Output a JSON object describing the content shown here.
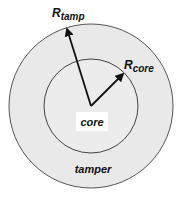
{
  "diagram": {
    "labels": {
      "r_tamp_main": "R",
      "r_tamp_sub": "tamp",
      "r_core_main": "R",
      "r_core_sub": "core",
      "core": "core",
      "tamper": "tamper"
    },
    "geometry": {
      "center": [
        91,
        106
      ],
      "outer_radius": 82,
      "inner_radius": 47
    },
    "colors": {
      "background": "#ffffff",
      "tamper_fill": "#e9e9e9",
      "core_fill": "#ececec",
      "stroke": "#555555",
      "arrow": "#111111",
      "core_label_box": "#ffffff"
    }
  }
}
